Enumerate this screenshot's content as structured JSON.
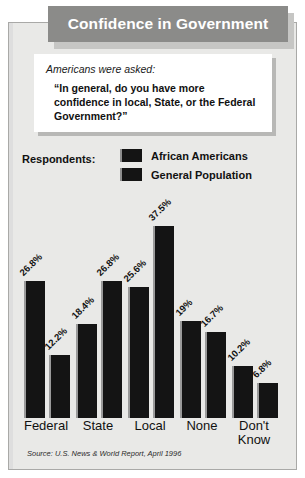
{
  "title": {
    "text": "Confidence in Government"
  },
  "quote": {
    "lead": "Americans were asked:",
    "question": "“In general, do you have more confidence in local, State, or the Federal Government?”"
  },
  "legend": {
    "title": "Respondents:",
    "items": [
      {
        "label": "African Americans",
        "color": "#141414"
      },
      {
        "label": "General Population",
        "color": "#141414"
      }
    ]
  },
  "source": {
    "text": "Source: U.S. News & World Report, April 1996"
  },
  "colors": {
    "panel_background": "#e9e9e7",
    "panel_border": "#a9a9a7",
    "title_bar": "#8b8b89",
    "title_shadow": "#c6c6c4",
    "title_text": "#ffffff",
    "quote_box": "#ffffff",
    "quote_shadow": "#b8b8b6",
    "bar": "#141414",
    "bar_highlight": "#9a9a9a",
    "text": "#111111"
  },
  "chart_data": {
    "type": "bar",
    "title": "Confidence in Government",
    "subtitle": "“In general, do you have more confidence in local, State, or the Federal Government?”",
    "xlabel": "",
    "ylabel": "",
    "ylim": [
      0,
      40
    ],
    "grid": false,
    "legend_position": "top",
    "value_suffix": "%",
    "categories": [
      "Federal",
      "State",
      "Local",
      "None",
      "Don't Know"
    ],
    "series": [
      {
        "name": "African Americans",
        "values": [
          26.8,
          18.4,
          25.6,
          19,
          10.2
        ],
        "labels": [
          "26.8%",
          "18.4%",
          "25.6%",
          "19%",
          "10.2%"
        ]
      },
      {
        "name": "General Population",
        "values": [
          12.2,
          26.8,
          37.5,
          16.7,
          6.8
        ],
        "labels": [
          "12.2%",
          "26.8%",
          "37.5%",
          "16.7%",
          "6.8%"
        ]
      }
    ],
    "source": "Source: U.S. News & World Report, April 1996"
  }
}
